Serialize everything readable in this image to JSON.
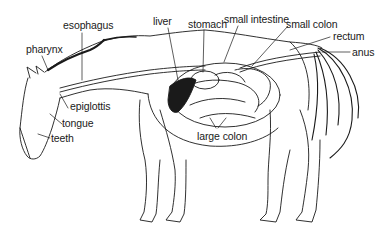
{
  "diagram": {
    "labels": {
      "esophagus": "esophagus",
      "pharynx": "pharynx",
      "liver": "liver",
      "stomach": "stomach",
      "small_intestine": "small intestine",
      "small_colon": "small colon",
      "rectum": "rectum",
      "anus": "anus",
      "epiglottis": "epiglottis",
      "tongue": "tongue",
      "teeth": "teeth",
      "large_colon": "large colon"
    },
    "colors": {
      "ink": "#1a1a1a",
      "background": "#ffffff"
    }
  }
}
